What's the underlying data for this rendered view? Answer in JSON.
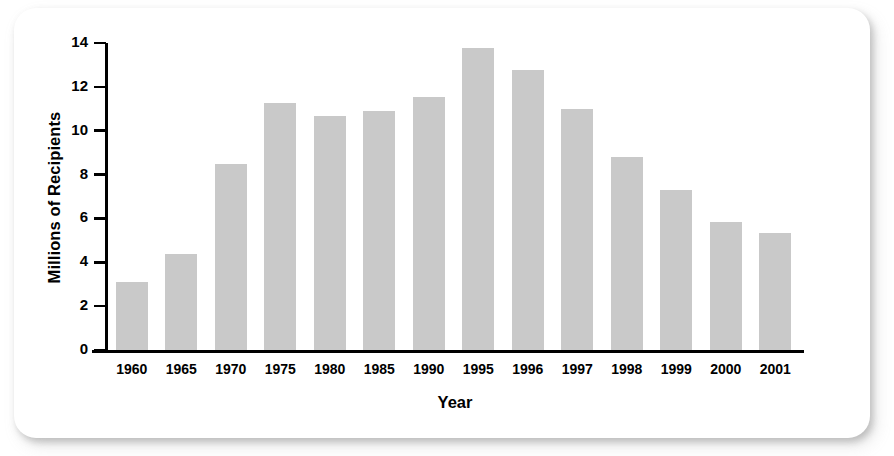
{
  "chart_data": {
    "type": "bar",
    "title": "",
    "subtitle": "",
    "xlabel": "Year",
    "ylabel": "Millions of Recipients",
    "categories": [
      "1960",
      "1965",
      "1970",
      "1975",
      "1980",
      "1985",
      "1990",
      "1995",
      "1996",
      "1997",
      "1998",
      "1999",
      "2000",
      "2001"
    ],
    "values": [
      3.1,
      4.4,
      8.5,
      11.25,
      10.65,
      10.9,
      11.55,
      13.75,
      12.75,
      11.0,
      8.8,
      7.3,
      5.85,
      5.35
    ],
    "ylim": [
      0,
      14
    ],
    "yticks": [
      0,
      2,
      4,
      6,
      8,
      10,
      12,
      14
    ],
    "ytick_labels": [
      "0",
      "2",
      "4",
      "6",
      "8",
      "10",
      "12",
      "14"
    ],
    "grid": false,
    "legend": null,
    "bar_color": "#c9c9c9",
    "axis_color": "#000000",
    "annotations": []
  },
  "panel": {
    "background": "#ffffff"
  }
}
